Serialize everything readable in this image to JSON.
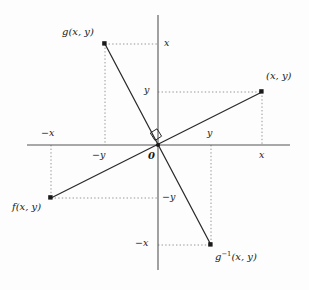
{
  "figure": {
    "kind": "cartesian-coordinate-diagram",
    "background_color": "#fdfdfd",
    "ink_color": "#2a2a2a",
    "axis_color": "#555555",
    "dotted_color": "#8a8a8a",
    "origin_label": "0",
    "axes": {
      "x_axis": {
        "from_px": [
          27,
          145
        ],
        "to_px": [
          290,
          145
        ]
      },
      "y_axis": {
        "from_px": [
          158,
          15
        ],
        "to_px": [
          158,
          270
        ]
      },
      "origin_px": [
        158,
        145
      ]
    },
    "right_angle_marker": {
      "name": "right-angle-marker",
      "description": "small square at origin indicating the two lines are perpendicular",
      "px": [
        158,
        145
      ]
    },
    "points": [
      {
        "id": "point-xy",
        "label": "(x, y)",
        "label_html": "(<i>x</i>, <i>y</i>)",
        "coords": [
          "x",
          "y"
        ],
        "px": [
          262,
          92
        ],
        "label_px": [
          266,
          76
        ],
        "quadrant": "I"
      },
      {
        "id": "point-g-xy",
        "label": "g(x, y)",
        "label_html": "<i>g</i>(<i>x</i>, <i>y</i>)",
        "coords": [
          "-y",
          "x"
        ],
        "px": [
          105,
          44
        ],
        "label_px": [
          62,
          32
        ],
        "quadrant": "II"
      },
      {
        "id": "point-f-xy",
        "label": "f(x, y)",
        "label_html": "<i>f</i>(<i>x</i>, <i>y</i>)",
        "coords": [
          "-x",
          "-y"
        ],
        "px": [
          51,
          198
        ],
        "label_px": [
          14,
          205
        ],
        "quadrant": "III"
      },
      {
        "id": "point-g-inverse-xy",
        "label": "g⁻¹(x, y)",
        "label_html": "<i>g</i><sup>−1</sup>(<i>x</i>, <i>y</i>)",
        "coords": [
          "y",
          "-x"
        ],
        "px": [
          211,
          245
        ],
        "label_px": [
          216,
          255
        ],
        "quadrant": "IV"
      }
    ],
    "lines": [
      {
        "id": "line-f-to-xy",
        "description": "line of positive slope through origin joining f(x, y) and (x, y)",
        "from_px": [
          51,
          198
        ],
        "to_px": [
          262,
          92
        ]
      },
      {
        "id": "line-g-to-g-inverse",
        "description": "line of negative slope through origin joining g(x, y) and g⁻¹(x, y)",
        "from_px": [
          105,
          44
        ],
        "to_px": [
          211,
          245
        ]
      }
    ],
    "tick_labels": [
      {
        "id": "tick-x-top",
        "text": "x",
        "px": [
          164,
          40
        ],
        "axis": "y",
        "sign": "positive"
      },
      {
        "id": "tick-y-upper",
        "text": "y",
        "px": [
          146,
          87
        ],
        "axis": "y",
        "sign": "positive"
      },
      {
        "id": "tick-neg-x-left",
        "text": "−x",
        "px": [
          44,
          131
        ],
        "axis": "x",
        "sign": "negative"
      },
      {
        "id": "tick-neg-y-left",
        "text": "−y",
        "px": [
          95,
          151
        ],
        "axis": "x",
        "sign": "negative"
      },
      {
        "id": "tick-y-right",
        "text": "y",
        "px": [
          208,
          131
        ],
        "axis": "x",
        "sign": "positive"
      },
      {
        "id": "tick-x-right",
        "text": "x",
        "px": [
          260,
          151
        ],
        "axis": "x",
        "sign": "positive"
      },
      {
        "id": "tick-neg-y-lower",
        "text": "−y",
        "px": [
          163,
          194
        ],
        "axis": "y",
        "sign": "negative"
      },
      {
        "id": "tick-neg-x-lower",
        "text": "−x",
        "px": [
          138,
          240
        ],
        "axis": "y",
        "sign": "negative"
      }
    ],
    "guide_lines": [
      {
        "id": "guide-xy-horizontal",
        "from_px": [
          158,
          92
        ],
        "to_px": [
          262,
          92
        ]
      },
      {
        "id": "guide-xy-vertical",
        "from_px": [
          262,
          92
        ],
        "to_px": [
          262,
          145
        ]
      },
      {
        "id": "guide-g-horizontal",
        "from_px": [
          105,
          44
        ],
        "to_px": [
          158,
          44
        ]
      },
      {
        "id": "guide-g-vertical",
        "from_px": [
          105,
          44
        ],
        "to_px": [
          105,
          145
        ]
      },
      {
        "id": "guide-f-horizontal",
        "from_px": [
          51,
          198
        ],
        "to_px": [
          158,
          198
        ]
      },
      {
        "id": "guide-f-vertical",
        "from_px": [
          51,
          145
        ],
        "to_px": [
          51,
          198
        ]
      },
      {
        "id": "guide-ginv-horizontal",
        "from_px": [
          158,
          245
        ],
        "to_px": [
          211,
          245
        ]
      },
      {
        "id": "guide-ginv-vertical",
        "from_px": [
          211,
          145
        ],
        "to_px": [
          211,
          245
        ]
      }
    ]
  }
}
